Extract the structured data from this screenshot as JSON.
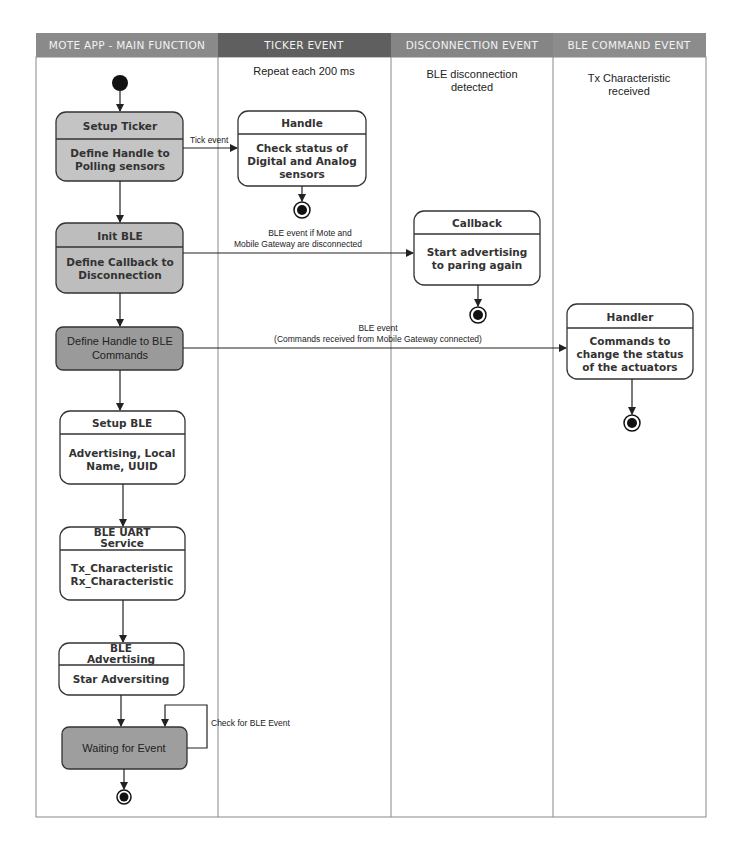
{
  "lanes": [
    {
      "header": "MOTE APP - MAIN FUNCTION",
      "subtitle": []
    },
    {
      "header": "TICKER  EVENT",
      "subtitle": [
        "Repeat each 200 ms"
      ]
    },
    {
      "header": "DISCONNECTION EVENT",
      "subtitle": [
        "BLE disconnection",
        "detected"
      ]
    },
    {
      "header": "BLE COMMAND EVENT",
      "subtitle": [
        "Tx Characteristic",
        "received"
      ]
    }
  ],
  "main_nodes": {
    "setup_ticker": {
      "title": "Setup Ticker",
      "body": [
        "Define Handle to",
        "Polling sensors"
      ]
    },
    "init_ble": {
      "title": "Init BLE",
      "body": [
        "Define Callback to",
        "Disconnection"
      ]
    },
    "define_handle": {
      "body": [
        "Define Handle to BLE",
        "Commands"
      ]
    },
    "setup_ble": {
      "title": "Setup BLE",
      "body": [
        "Advertising, Local",
        "Name, UUID"
      ]
    },
    "uart_service": {
      "title": [
        "BLE UART",
        "Service"
      ],
      "body": [
        "Tx_Characteristic",
        "Rx_Characteristic"
      ]
    },
    "ble_advertising": {
      "title": [
        "BLE",
        "Advertising"
      ],
      "body": [
        "Star Adversiting"
      ]
    },
    "waiting": {
      "body": [
        "Waiting for Event"
      ]
    }
  },
  "event_nodes": {
    "handle": {
      "title": "Handle",
      "body": [
        "Check status of",
        "Digital and Analog",
        "sensors"
      ]
    },
    "callback": {
      "title": "Callback",
      "body": [
        "Start advertising",
        "to paring again"
      ]
    },
    "handler": {
      "title": "Handler",
      "body": [
        "Commands to",
        "change the status",
        "of the actuators"
      ]
    }
  },
  "edges": {
    "tick": [
      "Tick event"
    ],
    "disconnect": [
      "BLE event  if Mote and",
      "Mobile Gateway are disconnected"
    ],
    "command": [
      "BLE event",
      "(Commands received from Mobile Gateway connected)"
    ],
    "self_loop": [
      "Check for BLE Event"
    ]
  },
  "colors": {
    "header_main": "#8a8a8a",
    "header_ticker": "#5f5f5f",
    "header_disconnection": "#858585",
    "header_command": "#8c8c8c",
    "node_light": "#c4c4c4",
    "node_dark": "#9a9a9a",
    "node_white": "#ffffff"
  }
}
